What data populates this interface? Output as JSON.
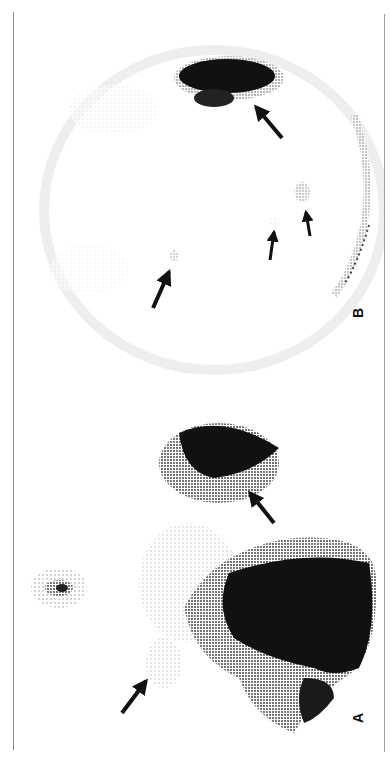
{
  "figure": {
    "orientation": "rotated 90° counter-clockwise",
    "panels": [
      {
        "id": "B",
        "label": "B",
        "arrows": 4,
        "description": "Scintigraphic image with a dense uptake region (upper) and three faint focal uptakes indicated by arrows, with a speckled curved rim on the right"
      },
      {
        "id": "A",
        "label": "A",
        "arrows": 2,
        "description": "Scintigraphic image with large dense uptake regions (upper and lower right), a small focal uptake at left, and a faint area indicated by an arrow"
      }
    ],
    "colors": {
      "background": "#ffffff",
      "ink": "#111111",
      "rule": "#8a8a8a"
    }
  }
}
